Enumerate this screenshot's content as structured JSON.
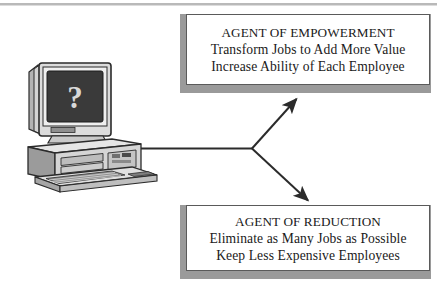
{
  "diagram": {
    "type": "branching-flow",
    "title": "",
    "source_node": {
      "name": "computer-illustration",
      "screen_symbol": "?",
      "description_parts": [
        "monitor",
        "system-unit",
        "keyboard"
      ]
    },
    "branches": [
      {
        "id": "empowerment",
        "direction": "up-right",
        "arrow": "arrow-up-right"
      },
      {
        "id": "reduction",
        "direction": "down-right",
        "arrow": "arrow-down-right"
      }
    ],
    "nodes": [
      {
        "id": "empowerment",
        "title": "AGENT OF EMPOWERMENT",
        "lines": [
          "Transform Jobs to Add More Value",
          "Increase Ability of Each Employee"
        ]
      },
      {
        "id": "reduction",
        "title": "AGENT OF REDUCTION",
        "lines": [
          "Eliminate as Many Jobs as Possible",
          "Keep Less Expensive Employees"
        ]
      }
    ]
  },
  "colors": {
    "ink": "#1a1a1a",
    "box_border": "#5a5a5a",
    "box_fill": "#ffffff",
    "shadow": "#9a9a9a",
    "connector": "#2b2b2b",
    "screen": "#3a3a3a",
    "case_light": "#e6e6e6",
    "case_mid": "#c9c9c9",
    "case_dark": "#8f8f8f",
    "outline": "#2b2b2b",
    "page": "#ffffff",
    "top_rule": "#b9b9b9"
  }
}
